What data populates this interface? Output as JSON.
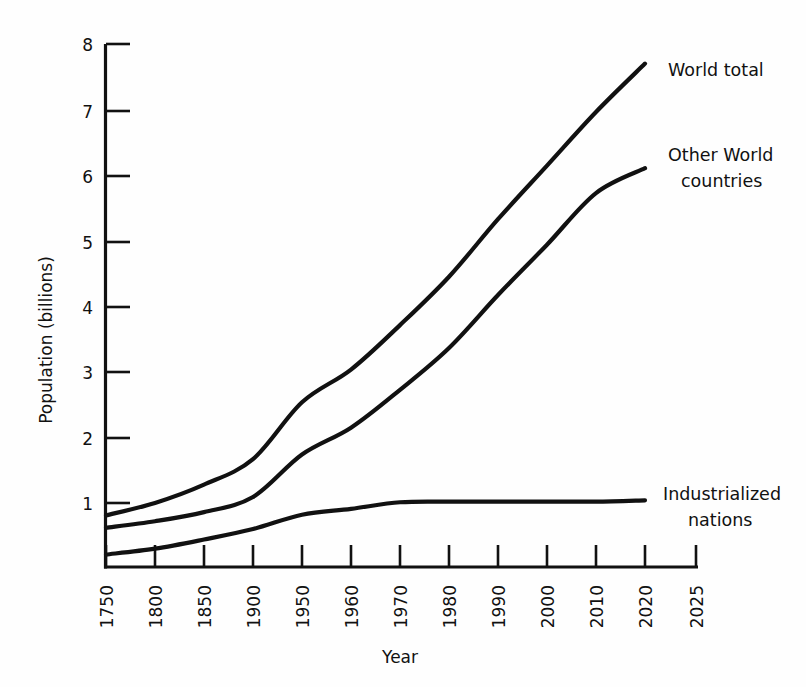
{
  "chart_data": {
    "type": "line",
    "title": "",
    "xlabel": "Year",
    "ylabel": "Population (billions)",
    "ylim": [
      0,
      8
    ],
    "grid": false,
    "legend_position": "at-curve-ends",
    "x_tick_labels": [
      "1750",
      "1800",
      "1850",
      "1900",
      "1950",
      "1960",
      "1970",
      "1980",
      "1990",
      "2000",
      "2010",
      "2020",
      "2025"
    ],
    "y_tick_labels": [
      "1",
      "2",
      "3",
      "4",
      "5",
      "6",
      "7",
      "8"
    ],
    "y_tick_values": [
      1,
      2,
      3,
      4,
      5,
      6,
      7,
      8
    ],
    "x_tick_values": [
      1750,
      1800,
      1850,
      1900,
      1950,
      1960,
      1970,
      1980,
      1990,
      2000,
      2010,
      2020,
      2025
    ],
    "series": [
      {
        "name": "World total",
        "label_lines": [
          "World total"
        ],
        "x": [
          1750,
          1800,
          1850,
          1900,
          1950,
          1960,
          1970,
          1980,
          1990,
          2000,
          2010,
          2020
        ],
        "values": [
          0.79,
          0.98,
          1.26,
          1.65,
          2.52,
          3.02,
          3.7,
          4.44,
          5.32,
          6.14,
          6.96,
          7.7
        ]
      },
      {
        "name": "Other World countries",
        "label_lines": [
          "Other  World",
          "countries"
        ],
        "x": [
          1750,
          1800,
          1850,
          1900,
          1950,
          1960,
          1970,
          1980,
          1990,
          2000,
          2010,
          2020
        ],
        "values": [
          0.6,
          0.7,
          0.84,
          1.07,
          1.72,
          2.13,
          2.71,
          3.35,
          4.16,
          4.93,
          5.72,
          6.1
        ]
      },
      {
        "name": "Industrialized nations",
        "label_lines": [
          "Industrialized",
          "nations"
        ],
        "x": [
          1750,
          1800,
          1850,
          1900,
          1950,
          1960,
          1970,
          1980,
          1990,
          2000,
          2010,
          2020
        ],
        "values": [
          0.19,
          0.28,
          0.42,
          0.58,
          0.8,
          0.89,
          0.99,
          1.0,
          1.0,
          1.0,
          1.0,
          1.02
        ]
      }
    ]
  },
  "axes": {
    "y_axis_title": "Population (billions)",
    "x_axis_title": "Year"
  },
  "colors": {
    "ink": "#111111",
    "background": "#fefefe"
  }
}
